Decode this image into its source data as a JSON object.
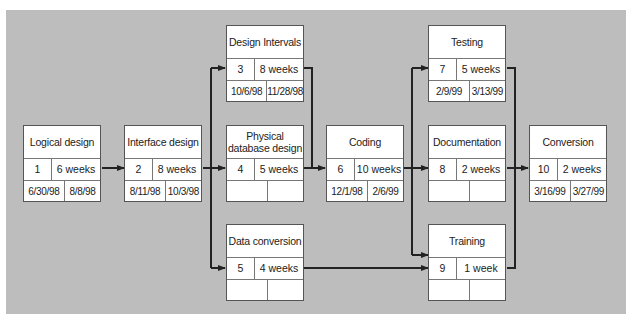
{
  "diagram": {
    "type": "PERT network chart",
    "background_color": "#bdbdbd",
    "nodes": [
      {
        "id": 1,
        "title": "Logical design",
        "number": "1",
        "duration": "6 weeks",
        "start": "6/30/98",
        "end": "8/8/98"
      },
      {
        "id": 2,
        "title": "Interface design",
        "number": "2",
        "duration": "8 weeks",
        "start": "8/11/98",
        "end": "10/3/98"
      },
      {
        "id": 3,
        "title": "Design Intervals",
        "number": "3",
        "duration": "8 weeks",
        "start": "10/6/98",
        "end": "11/28/98"
      },
      {
        "id": 4,
        "title": "Physical database design",
        "number": "4",
        "duration": "5 weeks",
        "start": "",
        "end": ""
      },
      {
        "id": 5,
        "title": "Data conversion",
        "number": "5",
        "duration": "4 weeks",
        "start": "",
        "end": ""
      },
      {
        "id": 6,
        "title": "Coding",
        "number": "6",
        "duration": "10 weeks",
        "start": "12/1/98",
        "end": "2/6/99"
      },
      {
        "id": 7,
        "title": "Testing",
        "number": "7",
        "duration": "5 weeks",
        "start": "2/9/99",
        "end": "3/13/99"
      },
      {
        "id": 8,
        "title": "Documentation",
        "number": "8",
        "duration": "2 weeks",
        "start": "",
        "end": ""
      },
      {
        "id": 9,
        "title": "Training",
        "number": "9",
        "duration": "1 week",
        "start": "",
        "end": ""
      },
      {
        "id": 10,
        "title": "Conversion",
        "number": "10",
        "duration": "2 weeks",
        "start": "3/16/99",
        "end": "3/27/99"
      }
    ],
    "edges": [
      {
        "from": 1,
        "to": 2
      },
      {
        "from": 2,
        "to": 3
      },
      {
        "from": 2,
        "to": 4
      },
      {
        "from": 2,
        "to": 5
      },
      {
        "from": 3,
        "to": 6
      },
      {
        "from": 4,
        "to": 6
      },
      {
        "from": 5,
        "to": 9
      },
      {
        "from": 6,
        "to": 7
      },
      {
        "from": 6,
        "to": 8
      },
      {
        "from": 6,
        "to": 9
      },
      {
        "from": 7,
        "to": 10
      },
      {
        "from": 8,
        "to": 10
      },
      {
        "from": 9,
        "to": 10
      }
    ]
  }
}
